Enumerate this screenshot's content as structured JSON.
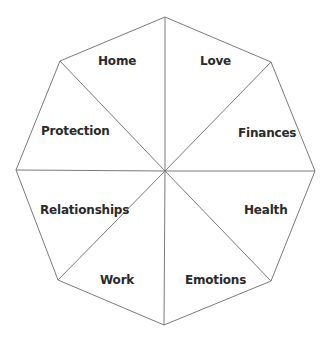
{
  "diagram": {
    "type": "octagon-wheel",
    "line_color": "#7a7a7a",
    "text_color": "#2a2a2a",
    "center": [
      165,
      171
    ],
    "vertices": [
      [
        165,
        17
      ],
      [
        271,
        62
      ],
      [
        315,
        171
      ],
      [
        271,
        281
      ],
      [
        164,
        325
      ],
      [
        58,
        280
      ],
      [
        16,
        170
      ],
      [
        60,
        61
      ]
    ],
    "segments": [
      {
        "label": "Love",
        "x": 200,
        "y": 54
      },
      {
        "label": "Finances",
        "x": 239,
        "y": 126
      },
      {
        "label": "Health",
        "x": 244,
        "y": 203
      },
      {
        "label": "Emotions",
        "x": 186,
        "y": 273
      },
      {
        "label": "Work",
        "x": 100,
        "y": 273
      },
      {
        "label": "Relationships",
        "x": 40,
        "y": 203
      },
      {
        "label": "Protection",
        "x": 41,
        "y": 124
      },
      {
        "label": "Home",
        "x": 98,
        "y": 54
      }
    ]
  }
}
